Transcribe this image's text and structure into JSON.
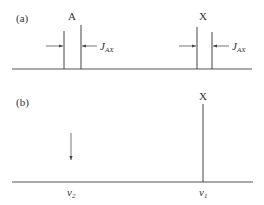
{
  "colors": {
    "line": "#555555",
    "text": "#333333",
    "background": "#ffffff"
  },
  "panel_a": {
    "label": "(a)",
    "peak_a": {
      "label": "A"
    },
    "peak_x": {
      "label": "X"
    },
    "coupling_label_main": "J",
    "coupling_label_sub": "AX"
  },
  "panel_b": {
    "label": "(b)",
    "peak_x": {
      "label": "X"
    },
    "axis_left_main": "v",
    "axis_left_sub": "2",
    "axis_right_main": "v",
    "axis_right_sub": "1",
    "arrow": "down-arrow"
  }
}
